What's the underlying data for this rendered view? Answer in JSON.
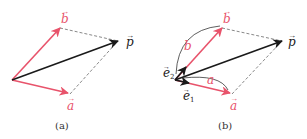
{
  "colors": {
    "red": "#e8536b",
    "black": "#1a1a1a",
    "dashed": "#888888"
  },
  "panels": [
    {
      "caption": "(a)",
      "labels": {
        "b": "b",
        "p": "p",
        "a": "a"
      }
    },
    {
      "caption": "(b)",
      "labels": {
        "b": "b",
        "p": "p",
        "a": "a",
        "b_len": "b",
        "a_len": "a",
        "e1": "e",
        "e1_sub": "1",
        "e2": "e",
        "e2_sub": "2"
      }
    }
  ]
}
